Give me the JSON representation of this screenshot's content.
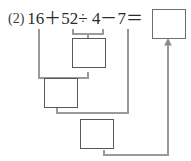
{
  "problem": {
    "number_label": "(2)",
    "expression": "16＋52÷ 4－7＝",
    "operands": [
      "16",
      "52",
      "4",
      "7"
    ],
    "operators": [
      "＋",
      "÷",
      "－",
      "＝"
    ]
  },
  "answer_box": {
    "name": "answer-box",
    "value": "",
    "placeholder": ""
  },
  "work_boxes": [
    {
      "name": "step-1-box",
      "value": "",
      "placeholder": "",
      "step": "52÷4"
    },
    {
      "name": "step-2-box",
      "value": "",
      "placeholder": "",
      "step": "16＋□"
    },
    {
      "name": "step-3-box",
      "value": "",
      "placeholder": "",
      "step": "□－7"
    }
  ],
  "colors": {
    "text": "#2b2b2b",
    "box_border": "#55595c",
    "connector": "#9a9a9a",
    "background": "#ffffff"
  },
  "connectors": [
    {
      "name": "divide-bracket",
      "from": "52÷4",
      "to": "step-1-box"
    },
    {
      "name": "add-elbow",
      "from": "16",
      "to": "step-2-box"
    },
    {
      "name": "step1-to-step2",
      "from": "step-1-box",
      "to": "step-2-box"
    },
    {
      "name": "subtract-elbow",
      "from": "7",
      "to": "step-3-box"
    },
    {
      "name": "step2-to-step3",
      "from": "step-2-box",
      "to": "step-3-box"
    },
    {
      "name": "step3-to-answer-arrow",
      "from": "step-3-box",
      "to": "answer-box"
    }
  ]
}
